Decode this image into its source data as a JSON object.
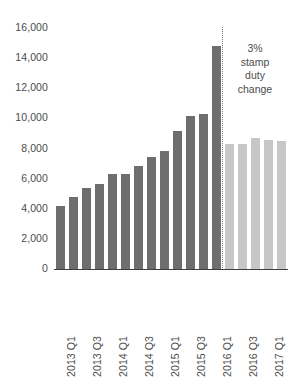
{
  "chart_data": {
    "type": "bar",
    "title": "",
    "subtitle": "",
    "xlabel": "",
    "ylabel": "",
    "ylim": [
      0,
      16000
    ],
    "ytick_values": [
      0,
      2000,
      4000,
      6000,
      8000,
      10000,
      12000,
      14000,
      16000
    ],
    "ytick_labels": [
      "0",
      "2,000",
      "4,000",
      "6,000",
      "8,000",
      "10,000",
      "12,000",
      "14,000",
      "16,000"
    ],
    "grid": false,
    "legend": null,
    "categories": [
      "2013 Q1",
      "2013 Q2",
      "2013 Q3",
      "2013 Q4",
      "2014 Q1",
      "2014 Q2",
      "2014 Q3",
      "2014 Q4",
      "2015 Q1",
      "2015 Q2",
      "2015 Q3",
      "2015 Q4",
      "2016 Q1",
      "2016 Q2",
      "2016 Q3",
      "2016 Q4",
      "2017 Q1",
      "2017 Q2"
    ],
    "xtick_labels": [
      "2013 Q1",
      "2013 Q3",
      "2014 Q1",
      "2014 Q3",
      "2015 Q1",
      "2015 Q3",
      "2016 Q1",
      "2016 Q3",
      "2017 Q1"
    ],
    "xtick_indices": [
      0,
      2,
      4,
      6,
      8,
      10,
      12,
      14,
      16
    ],
    "values": [
      4150,
      4750,
      5350,
      5650,
      6250,
      6250,
      6800,
      7400,
      7800,
      9150,
      10150,
      10250,
      14750,
      8250,
      8250,
      8650,
      8550,
      8450
    ],
    "bar_colors": [
      "#6e6e6e",
      "#6e6e6e",
      "#6e6e6e",
      "#6e6e6e",
      "#6e6e6e",
      "#6e6e6e",
      "#6e6e6e",
      "#6e6e6e",
      "#6e6e6e",
      "#6e6e6e",
      "#6e6e6e",
      "#6e6e6e",
      "#6e6e6e",
      "#c7c7c7",
      "#c7c7c7",
      "#c7c7c7",
      "#c7c7c7",
      "#c7c7c7"
    ],
    "annotations": [
      {
        "name": "stamp-duty-note",
        "lines": [
          "3%",
          "stamp",
          "duty",
          "change"
        ],
        "after_index": 12
      }
    ],
    "divider": {
      "name": "policy-change-divider",
      "after_index": 12,
      "style": "dotted",
      "color": "#7a7a7a"
    },
    "colors": {
      "bar_before": "#6e6e6e",
      "bar_after": "#c7c7c7",
      "axis": "#3f3f3f",
      "text": "#4c4c4c",
      "background": "#ffffff"
    }
  }
}
